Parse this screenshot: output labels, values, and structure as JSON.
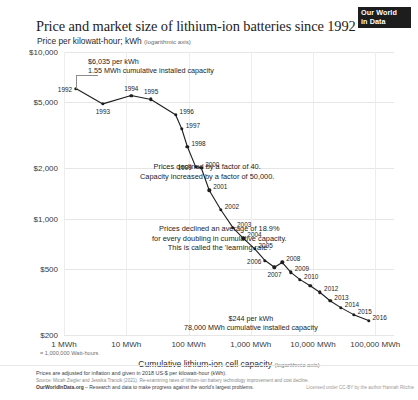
{
  "header": {
    "title": "Price and market size of lithium-ion batteries since 1992",
    "subtitle": "Price per kilowatt-hour; kWh",
    "subtitle_axis_note": "(logarithmic axis)",
    "logo_line1": "Our World",
    "logo_line2": "in Data"
  },
  "annotations": {
    "start_line1": "$6,035 per kWh",
    "start_line2": "1.55 MWh cumulative installed capacity",
    "mid_line1": "Prices declined by a factor of 40.",
    "mid_line2": "Capacity increased by a factor of 50,000.",
    "learning_line1": "Prices declined an average of 18.9%",
    "learning_line2": "for every doubling in cumulative capacity.",
    "learning_line3": "This is called the 'learning rate'.",
    "end_line1": "$244 per kWh",
    "end_line2": "78,000 MWh cumulative installed capacity"
  },
  "footer": {
    "line1": "Prices are adjusted for inflation and given in 2018 US-$ per kilowatt-hour (kWh).",
    "line2": "Source: Micah Ziegler and Jessika Trancik (2021). Re-examining rates of lithium-ion battery technology improvement and cost decline.",
    "line3_site": "OurWorldInData.org",
    "line3_rest": "– Research and data to make progress against the world's largest problems.",
    "license": "Licensed under CC-BY by the author Hannah Ritchie"
  },
  "chart_data": {
    "type": "line",
    "title": "Price and market size of lithium-ion batteries since 1992",
    "xlabel": "Cumulative lithium-ion cell capacity",
    "xlabel_axis_note": "(logarithmic axis)",
    "xaxis_unit_note": "= 1,000,000 Watt-hours",
    "ylabel": "Price per kilowatt-hour; kWh",
    "x_scale": "log",
    "y_scale": "log",
    "xlim": [
      1,
      200000
    ],
    "ylim": [
      200,
      10000
    ],
    "grid": true,
    "legend": "none",
    "y_ticks": [
      {
        "value": 10000,
        "label": "$10,000"
      },
      {
        "value": 5000,
        "label": "$5,000"
      },
      {
        "value": 2000,
        "label": "$2,000"
      },
      {
        "value": 1000,
        "label": "$1,000"
      },
      {
        "value": 500,
        "label": "$500"
      },
      {
        "value": 200,
        "label": "$200"
      }
    ],
    "x_ticks": [
      {
        "value": 1,
        "label": "1 MWh"
      },
      {
        "value": 10,
        "label": "10 MWh"
      },
      {
        "value": 100,
        "label": "100 MWh"
      },
      {
        "value": 1000,
        "label": "1,000 MWh"
      },
      {
        "value": 10000,
        "label": "10,000 MWh"
      },
      {
        "value": 100000,
        "label": "100,000 MWh"
      }
    ],
    "series": [
      {
        "name": "Lithium-ion cell price vs cumulative capacity",
        "x_name": "Cumulative capacity (MWh)",
        "y_name": "Price (2018 US$ per kWh)",
        "points": [
          {
            "label": "1992",
            "x": 1.55,
            "y": 6035,
            "label_pos": "left"
          },
          {
            "label": "1993",
            "x": 4.2,
            "y": 4880,
            "label_pos": "below"
          },
          {
            "label": "1994",
            "x": 12.0,
            "y": 5480,
            "label_pos": "above"
          },
          {
            "label": "1995",
            "x": 25.0,
            "y": 5190,
            "label_pos": "above"
          },
          {
            "label": "1996",
            "x": 62.0,
            "y": 4200,
            "label_pos": "right"
          },
          {
            "label": "1997",
            "x": 78.0,
            "y": 3450,
            "label_pos": "right"
          },
          {
            "label": "1998",
            "x": 96.0,
            "y": 2700,
            "label_pos": "right"
          },
          {
            "label": "1999",
            "x": 130.0,
            "y": 2050,
            "label_pos": "left"
          },
          {
            "label": "2000",
            "x": 160.0,
            "y": 2020,
            "label_pos": "right"
          },
          {
            "label": "2001",
            "x": 215.0,
            "y": 1480,
            "label_pos": "right"
          },
          {
            "label": "2002",
            "x": 330.0,
            "y": 1130,
            "label_pos": "right"
          },
          {
            "label": "2003",
            "x": 520.0,
            "y": 880,
            "label_pos": "right"
          },
          {
            "label": "2004",
            "x": 760.0,
            "y": 760,
            "label_pos": "right"
          },
          {
            "label": "2005",
            "x": 1150.0,
            "y": 660,
            "label_pos": "right"
          },
          {
            "label": "2006",
            "x": 1700.0,
            "y": 560,
            "label_pos": "left"
          },
          {
            "label": "2007",
            "x": 2400.0,
            "y": 510,
            "label_pos": "below"
          },
          {
            "label": "2008",
            "x": 3200.0,
            "y": 545,
            "label_pos": "right"
          },
          {
            "label": "2009",
            "x": 4400.0,
            "y": 475,
            "label_pos": "right"
          },
          {
            "label": "2010",
            "x": 6200.0,
            "y": 430,
            "label_pos": "right"
          },
          {
            "label": "",
            "x": 9000.0,
            "y": 395,
            "label_pos": "none"
          },
          {
            "label": "2012",
            "x": 13000.0,
            "y": 360,
            "label_pos": "right"
          },
          {
            "label": "2013",
            "x": 19000.0,
            "y": 320,
            "label_pos": "right"
          },
          {
            "label": "2014",
            "x": 28000.0,
            "y": 292,
            "label_pos": "right"
          },
          {
            "label": "2015",
            "x": 45000.0,
            "y": 265,
            "label_pos": "right"
          },
          {
            "label": "2016",
            "x": 78000.0,
            "y": 244,
            "label_pos": "right"
          }
        ]
      }
    ],
    "callouts": [
      {
        "point": "1992",
        "value_price": "$6,035 per kWh",
        "value_capacity": "1.55 MWh cumulative installed capacity"
      },
      {
        "point": "2016",
        "value_price": "$244 per kWh",
        "value_capacity": "78,000 MWh cumulative installed capacity"
      }
    ],
    "text_annotations": [
      "Prices declined by a factor of 40.",
      "Capacity increased by a factor of 50,000.",
      "Prices declined an average of 18.9% for every doubling in cumulative capacity. This is called the 'learning rate'."
    ]
  }
}
